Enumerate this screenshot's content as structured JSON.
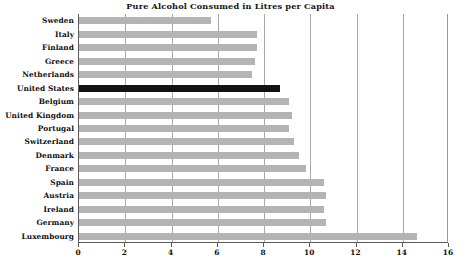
{
  "chart_data": {
    "type": "bar",
    "orientation": "horizontal",
    "title": "Pure Alcohol Consumed in Litres per Capita",
    "xlabel": "",
    "ylabel": "",
    "xlim": [
      0,
      16
    ],
    "xticks": [
      0,
      2,
      4,
      6,
      8,
      10,
      12,
      14,
      16
    ],
    "grid": true,
    "legend": null,
    "categories": [
      "Sweden",
      "Italy",
      "Finland",
      "Greece",
      "Netherlands",
      "United States",
      "Belgium",
      "United Kingdom",
      "Portugal",
      "Switzerland",
      "Denmark",
      "France",
      "Spain",
      "Austria",
      "Ireland",
      "Germany",
      "Luxembourg"
    ],
    "values": [
      5.7,
      7.7,
      7.7,
      7.6,
      7.5,
      8.7,
      9.1,
      9.2,
      9.1,
      9.3,
      9.5,
      9.8,
      10.6,
      10.7,
      10.6,
      10.7,
      14.6
    ],
    "highlighted_category": "United States",
    "colors": {
      "bar": "#b4b4b4",
      "bar_highlight": "#121212",
      "gridline": "#a8a8a8",
      "axis": "#5a5a5a",
      "background": "#ffffff",
      "text": "#101010"
    }
  }
}
